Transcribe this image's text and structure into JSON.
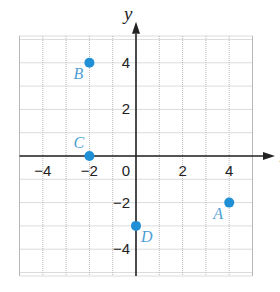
{
  "chart_data": {
    "type": "scatter",
    "title": "",
    "xlabel": "x",
    "ylabel": "y",
    "xlim": [
      -5,
      5
    ],
    "ylim": [
      -5,
      5
    ],
    "grid": true,
    "x_ticks": [
      -4,
      -2,
      0,
      2,
      4
    ],
    "y_ticks": [
      4,
      2,
      -2,
      -4
    ],
    "x_tick_labels": [
      "−4",
      "−2",
      "0",
      "2",
      "4"
    ],
    "y_tick_labels": [
      "4",
      "2",
      "−2",
      "−4"
    ],
    "points": [
      {
        "label": "A",
        "x": 4,
        "y": -2
      },
      {
        "label": "B",
        "x": -2,
        "y": 4
      },
      {
        "label": "C",
        "x": -2,
        "y": 0
      },
      {
        "label": "D",
        "x": 0,
        "y": -3
      }
    ],
    "point_color": "#1f8fd6",
    "label_color": "#4f9fd3"
  }
}
